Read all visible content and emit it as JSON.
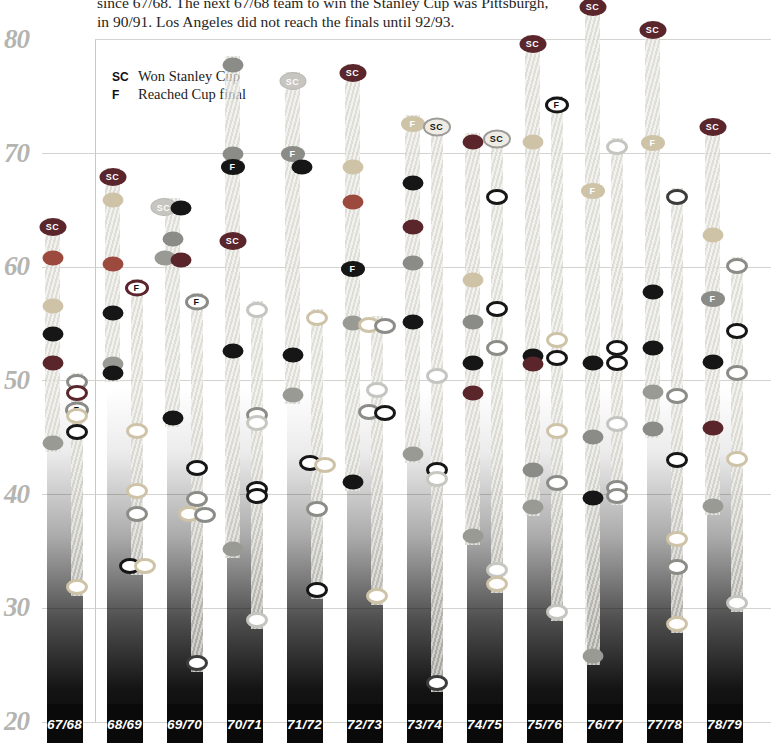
{
  "header": {
    "line1": "since 67/68. The next 67/68 team to win the Stanley Cup was Pittsburgh,",
    "line2": "in 90/91. Los Angeles did not reach the finals until 92/93."
  },
  "legend": {
    "sc_symbol": "SC",
    "sc_label": "Won Stanley Cup",
    "f_symbol": "F",
    "f_label": "Reached Cup final"
  },
  "colors": {
    "maroon": "#5a262c",
    "brick": "#9c4a3e",
    "tan": "#cfc3a7",
    "black": "#161616",
    "gray": "#8b8b87",
    "hatch": "#9a9a95",
    "lightgray": "#c7c7c2",
    "white_ring": "#c4c4c0",
    "dark_ring": "#3c3c3c",
    "silver": "#c6c5c0"
  },
  "chart_data": {
    "type": "scatter",
    "title": "",
    "ylabel": "points percentage (x100)",
    "ylim": [
      20,
      83
    ],
    "y_ticks": [
      80,
      70,
      60,
      50,
      40,
      30,
      20
    ],
    "grid": true,
    "marker_types": {
      "dot": "filled team dot (established team)",
      "ring": "open ring (expansion team)",
      "sc": "dark badge - won Stanley Cup",
      "scs": "silver badge - won Stanley Cup",
      "scr": "open badge - won Stanley Cup (expansion team)",
      "f": "filled badge - reached Cup final",
      "fr": "open badge - reached Cup final (expansion team)"
    },
    "seasons": [
      {
        "label": "67/68",
        "established": [
          {
            "v": 63.5,
            "t": "sc",
            "c": "maroon"
          },
          {
            "v": 60.8,
            "t": "dot",
            "c": "brick"
          },
          {
            "v": 56.6,
            "t": "dot",
            "c": "tan"
          },
          {
            "v": 54.1,
            "t": "dot",
            "c": "black"
          },
          {
            "v": 51.6,
            "t": "dot",
            "c": "maroon"
          },
          {
            "v": 44.5,
            "t": "dot",
            "c": "hatch"
          }
        ],
        "expansion": [
          {
            "v": 49.9,
            "t": "ring",
            "c": "gray"
          },
          {
            "v": 48.9,
            "t": "ring",
            "c": "maroon"
          },
          {
            "v": 47.4,
            "t": "fr",
            "c": "gray"
          },
          {
            "v": 46.9,
            "t": "ring",
            "c": "tan"
          },
          {
            "v": 45.5,
            "t": "ring",
            "c": "black"
          },
          {
            "v": 31.9,
            "t": "ring",
            "c": "tan"
          }
        ]
      },
      {
        "label": "68/69",
        "established": [
          {
            "v": 67.9,
            "t": "sc",
            "c": "maroon"
          },
          {
            "v": 65.9,
            "t": "dot",
            "c": "tan"
          },
          {
            "v": 60.3,
            "t": "dot",
            "c": "brick"
          },
          {
            "v": 56.0,
            "t": "dot",
            "c": "black"
          },
          {
            "v": 51.5,
            "t": "dot",
            "c": "hatch"
          },
          {
            "v": 50.7,
            "t": "dot",
            "c": "black"
          }
        ],
        "expansion": [
          {
            "v": 58.2,
            "t": "fr",
            "c": "maroon"
          },
          {
            "v": 45.6,
            "t": "ring",
            "c": "tan"
          },
          {
            "v": 40.3,
            "t": "ring",
            "c": "tan"
          },
          {
            "v": 38.3,
            "t": "ring",
            "c": "gray"
          },
          {
            "v": 33.7,
            "t": "ring",
            "c": "black",
            "dx": -7
          },
          {
            "v": 33.7,
            "t": "ring",
            "c": "tan",
            "dx": 8
          }
        ]
      },
      {
        "label": "69/70",
        "established": [
          {
            "v": 65.3,
            "t": "scs",
            "c": "silver",
            "dx": -9
          },
          {
            "v": 65.2,
            "t": "dot",
            "c": "black",
            "dx": 8
          },
          {
            "v": 62.5,
            "t": "dot",
            "c": "gray"
          },
          {
            "v": 60.8,
            "t": "dot",
            "c": "hatch",
            "dx": -8
          },
          {
            "v": 60.6,
            "t": "dot",
            "c": "maroon",
            "dx": 8
          },
          {
            "v": 46.7,
            "t": "dot",
            "c": "black"
          }
        ],
        "expansion": [
          {
            "v": 56.9,
            "t": "fr",
            "c": "gray"
          },
          {
            "v": 42.3,
            "t": "ring",
            "c": "black"
          },
          {
            "v": 39.6,
            "t": "ring",
            "c": "gray"
          },
          {
            "v": 38.3,
            "t": "ring",
            "c": "tan",
            "dx": -8
          },
          {
            "v": 38.2,
            "t": "ring",
            "c": "gray",
            "dx": 8
          },
          {
            "v": 25.2,
            "t": "ring",
            "c": "dark_ring"
          }
        ]
      },
      {
        "label": "70/71",
        "established": [
          {
            "v": 77.8,
            "t": "dot",
            "c": "gray"
          },
          {
            "v": 70.0,
            "t": "dot",
            "c": "gray"
          },
          {
            "v": 68.8,
            "t": "f",
            "c": "black"
          },
          {
            "v": 62.3,
            "t": "sc",
            "c": "maroon"
          },
          {
            "v": 52.6,
            "t": "dot",
            "c": "black"
          },
          {
            "v": 35.2,
            "t": "dot",
            "c": "hatch"
          }
        ],
        "expansion": [
          {
            "v": 56.2,
            "t": "ring",
            "c": "white_ring"
          },
          {
            "v": 47.0,
            "t": "ring",
            "c": "gray"
          },
          {
            "v": 46.3,
            "t": "ring",
            "c": "lightgray"
          },
          {
            "v": 40.5,
            "t": "ring",
            "c": "black"
          },
          {
            "v": 39.9,
            "t": "ring",
            "c": "black"
          },
          {
            "v": 29.0,
            "t": "ring",
            "c": "white_ring"
          }
        ]
      },
      {
        "label": "71/72",
        "established": [
          {
            "v": 76.4,
            "t": "scs",
            "c": "silver"
          },
          {
            "v": 70.0,
            "t": "f",
            "c": "gray"
          },
          {
            "v": 68.8,
            "t": "dot",
            "c": "black",
            "dx": 9
          },
          {
            "v": 52.3,
            "t": "dot",
            "c": "black"
          },
          {
            "v": 48.8,
            "t": "dot",
            "c": "hatch"
          }
        ],
        "expansion": [
          {
            "v": 55.5,
            "t": "ring",
            "c": "tan"
          },
          {
            "v": 42.8,
            "t": "ring",
            "c": "black",
            "dx": -7
          },
          {
            "v": 42.6,
            "t": "ring",
            "c": "tan",
            "dx": 8
          },
          {
            "v": 38.7,
            "t": "ring",
            "c": "gray"
          },
          {
            "v": 31.6,
            "t": "ring",
            "c": "black"
          }
        ]
      },
      {
        "label": "72/73",
        "established": [
          {
            "v": 77.1,
            "t": "sc",
            "c": "maroon"
          },
          {
            "v": 68.8,
            "t": "dot",
            "c": "tan"
          },
          {
            "v": 65.7,
            "t": "dot",
            "c": "brick"
          },
          {
            "v": 59.8,
            "t": "f",
            "c": "black"
          },
          {
            "v": 55.1,
            "t": "dot",
            "c": "hatch"
          },
          {
            "v": 41.1,
            "t": "dot",
            "c": "black"
          }
        ],
        "expansion": [
          {
            "v": 54.9,
            "t": "ring",
            "c": "tan",
            "dx": -8
          },
          {
            "v": 54.8,
            "t": "ring",
            "c": "gray",
            "dx": 8
          },
          {
            "v": 49.2,
            "t": "ring",
            "c": "white_ring"
          },
          {
            "v": 47.3,
            "t": "ring",
            "c": "gray",
            "dx": -8
          },
          {
            "v": 47.2,
            "t": "ring",
            "c": "black",
            "dx": 8
          },
          {
            "v": 31.1,
            "t": "ring",
            "c": "tan"
          }
        ]
      },
      {
        "label": "73/74",
        "established": [
          {
            "v": 72.6,
            "t": "f",
            "c": "tan"
          },
          {
            "v": 67.4,
            "t": "dot",
            "c": "black"
          },
          {
            "v": 63.5,
            "t": "dot",
            "c": "maroon"
          },
          {
            "v": 60.4,
            "t": "dot",
            "c": "gray"
          },
          {
            "v": 55.2,
            "t": "dot",
            "c": "black"
          },
          {
            "v": 43.6,
            "t": "dot",
            "c": "hatch"
          }
        ],
        "expansion": [
          {
            "v": 72.3,
            "t": "scr",
            "c": "silver"
          },
          {
            "v": 50.4,
            "t": "ring",
            "c": "white_ring"
          },
          {
            "v": 42.2,
            "t": "ring",
            "c": "black"
          },
          {
            "v": 41.4,
            "t": "ring",
            "c": "lightgray"
          },
          {
            "v": 23.4,
            "t": "ring",
            "c": "dark_ring"
          }
        ]
      },
      {
        "label": "74/75",
        "established": [
          {
            "v": 71.0,
            "t": "dot",
            "c": "maroon"
          },
          {
            "v": 58.9,
            "t": "dot",
            "c": "tan"
          },
          {
            "v": 55.2,
            "t": "dot",
            "c": "gray"
          },
          {
            "v": 51.6,
            "t": "dot",
            "c": "black"
          },
          {
            "v": 48.9,
            "t": "dot",
            "c": "maroon"
          },
          {
            "v": 36.4,
            "t": "dot",
            "c": "hatch"
          }
        ],
        "expansion": [
          {
            "v": 71.3,
            "t": "scr",
            "c": "silver"
          },
          {
            "v": 66.2,
            "t": "ring",
            "c": "black"
          },
          {
            "v": 56.3,
            "t": "ring",
            "c": "black"
          },
          {
            "v": 52.9,
            "t": "ring",
            "c": "gray"
          },
          {
            "v": 33.4,
            "t": "ring",
            "c": "lightgray"
          },
          {
            "v": 32.1,
            "t": "ring",
            "c": "tan"
          }
        ]
      },
      {
        "label": "75/76",
        "established": [
          {
            "v": 79.6,
            "t": "sc",
            "c": "maroon"
          },
          {
            "v": 71.0,
            "t": "dot",
            "c": "tan"
          },
          {
            "v": 52.2,
            "t": "dot",
            "c": "black"
          },
          {
            "v": 51.5,
            "t": "dot",
            "c": "maroon"
          },
          {
            "v": 42.2,
            "t": "dot",
            "c": "gray"
          },
          {
            "v": 38.9,
            "t": "dot",
            "c": "hatch"
          }
        ],
        "expansion": [
          {
            "v": 74.3,
            "t": "fr",
            "c": "black"
          },
          {
            "v": 53.6,
            "t": "ring",
            "c": "tan"
          },
          {
            "v": 52.0,
            "t": "ring",
            "c": "black"
          },
          {
            "v": 45.6,
            "t": "ring",
            "c": "tan"
          },
          {
            "v": 41.0,
            "t": "ring",
            "c": "gray"
          },
          {
            "v": 29.7,
            "t": "ring",
            "c": "white_ring"
          }
        ]
      },
      {
        "label": "76/77",
        "established": [
          {
            "v": 82.9,
            "t": "sc",
            "c": "maroon"
          },
          {
            "v": 66.7,
            "t": "f",
            "c": "tan"
          },
          {
            "v": 51.6,
            "t": "dot",
            "c": "black"
          },
          {
            "v": 45.1,
            "t": "dot",
            "c": "gray"
          },
          {
            "v": 39.7,
            "t": "dot",
            "c": "black"
          },
          {
            "v": 25.8,
            "t": "dot",
            "c": "hatch"
          }
        ],
        "expansion": [
          {
            "v": 70.6,
            "t": "ring",
            "c": "white_ring"
          },
          {
            "v": 52.9,
            "t": "ring",
            "c": "black"
          },
          {
            "v": 51.6,
            "t": "ring",
            "c": "black"
          },
          {
            "v": 46.2,
            "t": "ring",
            "c": "white_ring"
          },
          {
            "v": 40.6,
            "t": "ring",
            "c": "gray"
          },
          {
            "v": 39.9,
            "t": "ring",
            "c": "gray"
          }
        ]
      },
      {
        "label": "77/78",
        "established": [
          {
            "v": 80.9,
            "t": "sc",
            "c": "maroon"
          },
          {
            "v": 70.9,
            "t": "f",
            "c": "tan"
          },
          {
            "v": 57.8,
            "t": "dot",
            "c": "black"
          },
          {
            "v": 52.9,
            "t": "dot",
            "c": "black"
          },
          {
            "v": 49.0,
            "t": "dot",
            "c": "hatch"
          },
          {
            "v": 45.8,
            "t": "dot",
            "c": "gray"
          }
        ],
        "expansion": [
          {
            "v": 66.2,
            "t": "ring",
            "c": "dark_ring"
          },
          {
            "v": 48.7,
            "t": "ring",
            "c": "gray"
          },
          {
            "v": 43.0,
            "t": "ring",
            "c": "black"
          },
          {
            "v": 36.1,
            "t": "ring",
            "c": "tan"
          },
          {
            "v": 33.6,
            "t": "ring",
            "c": "gray"
          },
          {
            "v": 28.6,
            "t": "ring",
            "c": "tan"
          }
        ]
      },
      {
        "label": "78/79",
        "established": [
          {
            "v": 72.3,
            "t": "sc",
            "c": "maroon"
          },
          {
            "v": 62.8,
            "t": "dot",
            "c": "tan"
          },
          {
            "v": 57.2,
            "t": "f",
            "c": "gray"
          },
          {
            "v": 51.7,
            "t": "dot",
            "c": "black"
          },
          {
            "v": 45.9,
            "t": "dot",
            "c": "maroon"
          },
          {
            "v": 39.0,
            "t": "dot",
            "c": "hatch"
          }
        ],
        "expansion": [
          {
            "v": 60.1,
            "t": "ring",
            "c": "gray"
          },
          {
            "v": 54.4,
            "t": "ring",
            "c": "black"
          },
          {
            "v": 50.7,
            "t": "ring",
            "c": "gray"
          },
          {
            "v": 43.1,
            "t": "ring",
            "c": "tan"
          },
          {
            "v": 30.5,
            "t": "ring",
            "c": "white_ring"
          }
        ]
      }
    ]
  }
}
